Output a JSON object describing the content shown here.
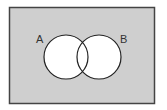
{
  "diagram": {
    "type": "venn",
    "universe": {
      "fill": "#cfcfcf",
      "stroke": "#444444"
    },
    "sets": [
      {
        "label": "A",
        "fill": "#ffffff",
        "stroke": "#222222"
      },
      {
        "label": "B",
        "fill": "#ffffff",
        "stroke": "#222222"
      }
    ]
  }
}
